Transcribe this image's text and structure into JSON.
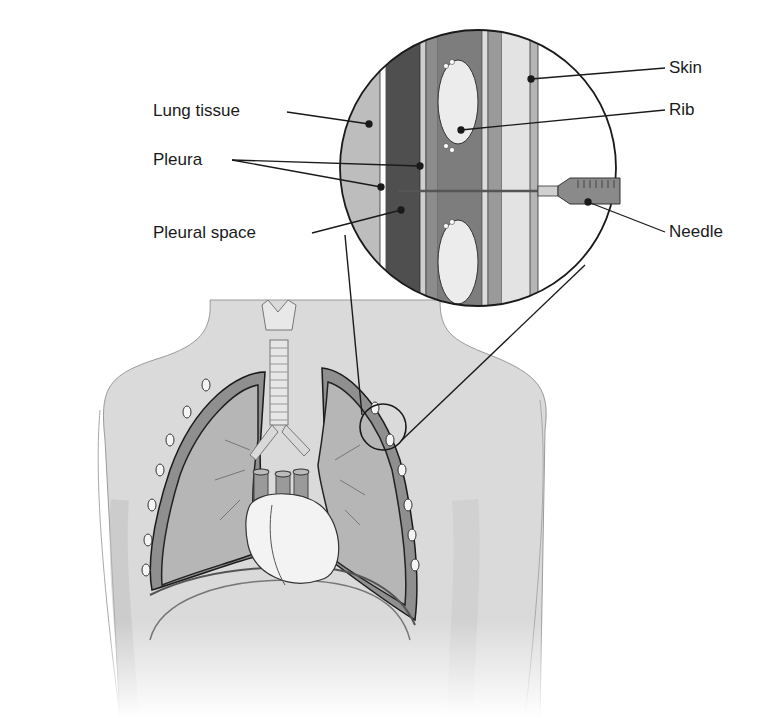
{
  "figure": {
    "labels": {
      "lung_tissue": "Lung tissue",
      "pleura": "Pleura",
      "pleural_space": "Pleural space",
      "skin": "Skin",
      "rib": "Rib",
      "needle": "Needle"
    },
    "colors": {
      "background": "#ffffff",
      "body": "#d8d8d8",
      "lung": "#b3b3b3",
      "pleural_space": "#555555",
      "rib": "#ececec",
      "muscle": "#8f8f8f",
      "skin": "#c9c9c9",
      "outline": "#1a1a1a"
    }
  }
}
